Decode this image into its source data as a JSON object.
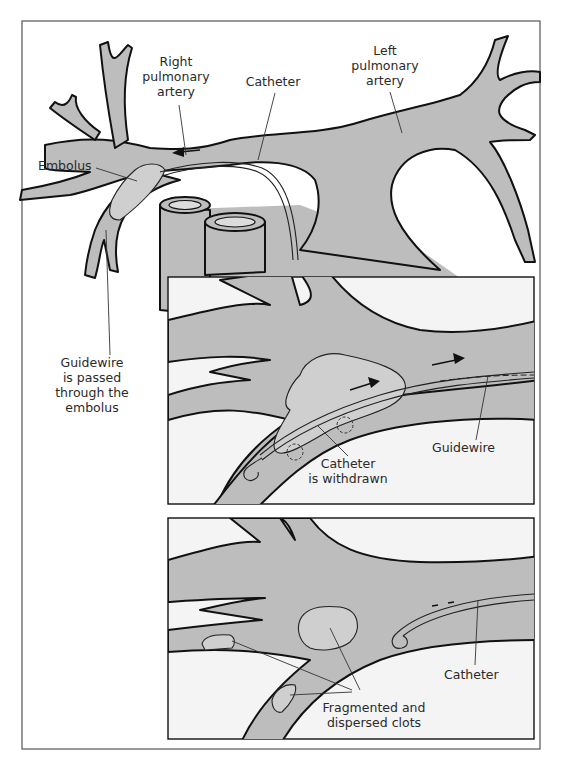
{
  "figure": {
    "panel_top": {
      "labels": {
        "right_pulmonary_artery": [
          "Right",
          "pulmonary",
          "artery"
        ],
        "catheter": "Catheter",
        "left_pulmonary_artery": [
          "Left",
          "pulmonary",
          "artery"
        ],
        "embolus": "Embolus",
        "guidewire_passed": [
          "Guidewire",
          "is passed",
          "through the",
          "embolus"
        ]
      },
      "arrow_direction": "left"
    },
    "panel_middle": {
      "labels": {
        "guidewire": "Guidewire",
        "catheter_withdrawn": [
          "Catheter",
          "is withdrawn"
        ]
      },
      "arrow_direction": "right"
    },
    "panel_bottom": {
      "labels": {
        "catheter": "Catheter",
        "fragmented_clots": [
          "Fragmented and",
          "dispersed clots"
        ]
      }
    },
    "colors": {
      "vessel_fill": "#bdbdbd",
      "clot_fill": "#cfcfcf",
      "panel_background": "#f4f4f4",
      "outline": "#111111"
    }
  }
}
